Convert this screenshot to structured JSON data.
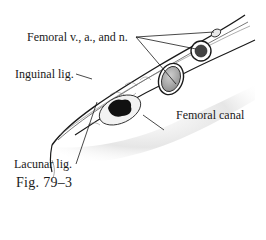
{
  "figure": {
    "caption": "Fig. 79–3",
    "labels": {
      "femoral_vessels": "Femoral v., a., and n.",
      "inguinal_ligament": "Inguinal lig.",
      "femoral_canal": "Femoral canal",
      "lacunar_ligament": "Lacunar lig."
    }
  },
  "colors": {
    "ink": "#1a1a1a",
    "shading": "#8a8a8a",
    "background": "#ffffff"
  }
}
